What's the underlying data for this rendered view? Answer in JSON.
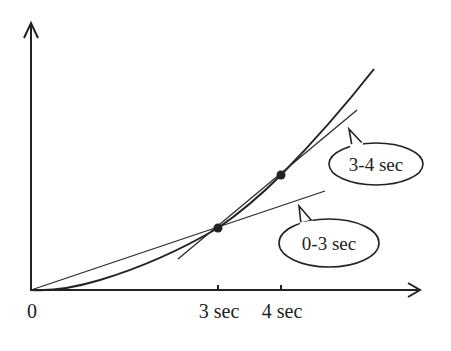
{
  "diagram": {
    "type": "position-time graph with secant lines",
    "origin_label": "0",
    "x_ticks": [
      {
        "label": "3 sec",
        "value": 3
      },
      {
        "label": "4 sec",
        "value": 4
      }
    ],
    "points": [
      {
        "t": 3,
        "label": "point at 3 sec"
      },
      {
        "t": 4,
        "label": "point at 4 sec"
      }
    ],
    "secants": [
      {
        "label": "0-3 sec",
        "from_t": 0,
        "to_t": 3
      },
      {
        "label": "3-4 sec",
        "from_t": 3,
        "to_t": 4
      }
    ],
    "colors": {
      "ink": "#222222",
      "background": "#ffffff"
    }
  }
}
